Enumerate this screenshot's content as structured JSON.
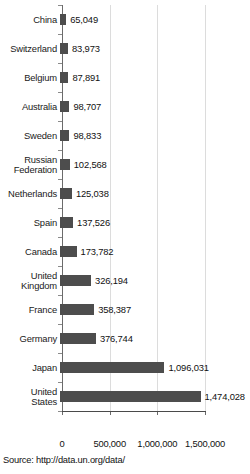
{
  "chart_data": {
    "type": "bar",
    "orientation": "horizontal",
    "title": "",
    "subtitle": "",
    "xlabel": "",
    "ylabel": "",
    "xlim": [
      0,
      1600000
    ],
    "grid": true,
    "legend": null,
    "xticks": [
      "0",
      "500,000",
      "1,000,000",
      "1,500,000"
    ],
    "xtick_values": [
      0,
      500000,
      1000000,
      1500000
    ],
    "categories": [
      "China",
      "Switzerland",
      "Belgium",
      "Australia",
      "Sweden",
      "Russian\nFederation",
      "Netherlands",
      "Spain",
      "Canada",
      "United\nKingdom",
      "France",
      "Germany",
      "Japan",
      "United\nStates"
    ],
    "values": [
      65049,
      83973,
      87891,
      98707,
      98833,
      102568,
      125038,
      137526,
      173782,
      326194,
      358387,
      376744,
      1096031,
      1474028
    ],
    "value_labels": [
      "65,049",
      "83,973",
      "87,891",
      "98,707",
      "98,833",
      "102,568",
      "125,038",
      "137,526",
      "173,782",
      "326,194",
      "358,387",
      "376,744",
      "1,096,031",
      "1,474,028"
    ],
    "bar_color": "#4d4d4d",
    "grid_color": "#dcdcdc",
    "axis_color": "#4a4a4a"
  },
  "source": {
    "text": "Source: http://data.un.org/data/"
  }
}
